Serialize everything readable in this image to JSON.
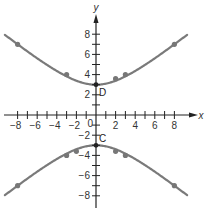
{
  "chart_data": {
    "type": "line",
    "title": "",
    "xlabel": "x",
    "ylabel": "y",
    "xlim": [
      -9.5,
      10
    ],
    "ylim": [
      -10,
      10
    ],
    "grid": false,
    "x_ticks": [
      -8,
      -7,
      -6,
      -5,
      -4,
      -3,
      -2,
      -1,
      1,
      2,
      3,
      4,
      5,
      6,
      7,
      8
    ],
    "x_tick_labels": [
      {
        "value": -8,
        "label": "−8"
      },
      {
        "value": -6,
        "label": "−6"
      },
      {
        "value": -4,
        "label": "−4"
      },
      {
        "value": -2,
        "label": "−2"
      },
      {
        "value": 2,
        "label": "2"
      },
      {
        "value": 4,
        "label": "4"
      },
      {
        "value": 6,
        "label": "6"
      },
      {
        "value": 8,
        "label": "8"
      }
    ],
    "y_ticks": [
      -8,
      -7,
      -6,
      -5,
      -4,
      -3,
      -2,
      -1,
      1,
      2,
      3,
      4,
      5,
      6,
      7,
      8
    ],
    "y_tick_labels": [
      {
        "value": 8,
        "label": "8"
      },
      {
        "value": 6,
        "label": "6"
      },
      {
        "value": 4,
        "label": "4"
      },
      {
        "value": 2,
        "label": "2"
      },
      {
        "value": -2,
        "label": "−2"
      },
      {
        "value": -4,
        "label": "−4"
      },
      {
        "value": -6,
        "label": "−6"
      },
      {
        "value": -8,
        "label": "−8"
      }
    ],
    "origin_label": "0",
    "series": [
      {
        "name": "upper branch",
        "color": "#7a7a7a",
        "points": [
          [
            -8,
            7
          ],
          [
            -3,
            4
          ],
          [
            0,
            3
          ],
          [
            2,
            3.6
          ],
          [
            3,
            4
          ],
          [
            8,
            7
          ]
        ]
      },
      {
        "name": "lower branch",
        "color": "#7a7a7a",
        "points": [
          [
            -8,
            -7
          ],
          [
            -3,
            -4
          ],
          [
            -2,
            -3.6
          ],
          [
            0,
            -3
          ],
          [
            2,
            -3.6
          ],
          [
            3,
            -4
          ],
          [
            8,
            -7
          ]
        ]
      }
    ],
    "annotations": [
      {
        "label": "D",
        "x": 0,
        "y": 3
      },
      {
        "label": "C",
        "x": 0,
        "y": -3
      }
    ]
  }
}
